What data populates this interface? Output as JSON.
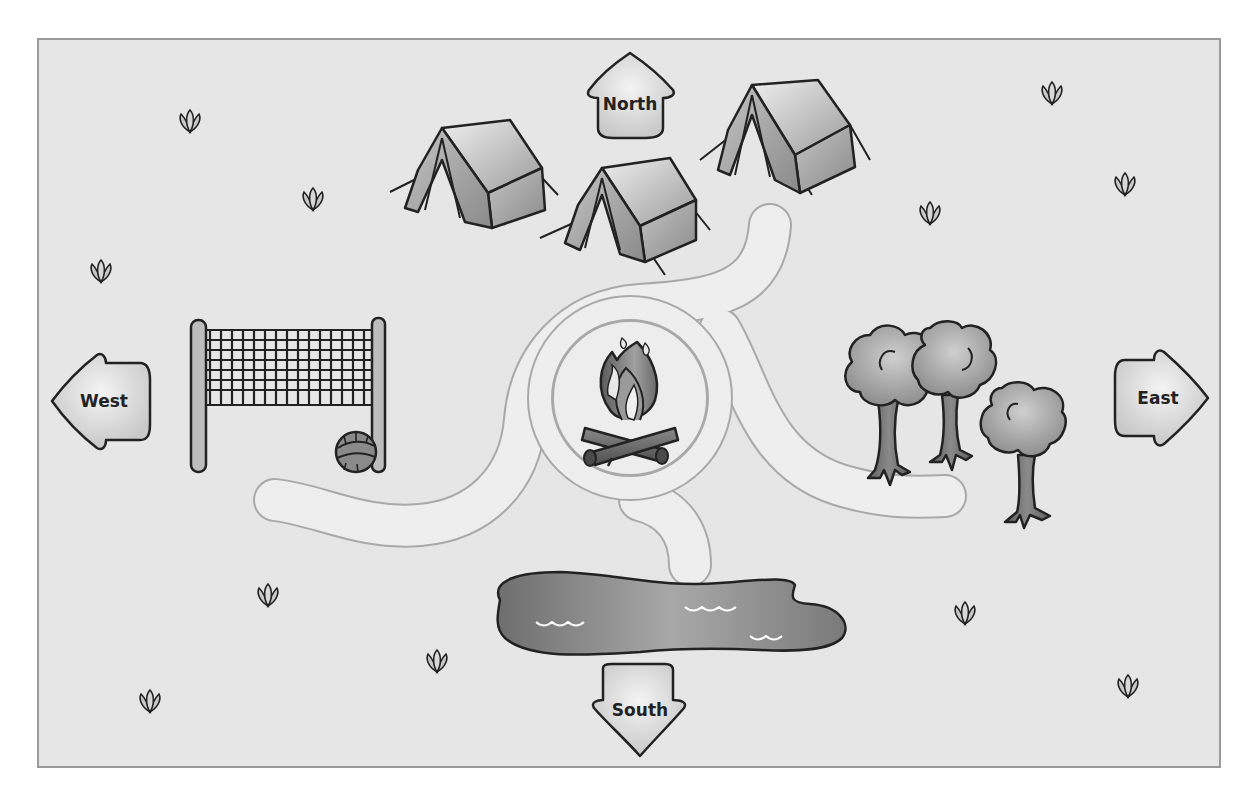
{
  "map": {
    "type": "campground-map",
    "background_color": "#e6e6e6",
    "frame_color": "#9a9a9a"
  },
  "compass": {
    "north": {
      "label": "North",
      "x": 630,
      "y": 100
    },
    "south": {
      "label": "South",
      "x": 640,
      "y": 710
    },
    "west": {
      "label": "West",
      "x": 97,
      "y": 401
    },
    "east": {
      "label": "East",
      "x": 1158,
      "y": 398
    }
  },
  "landmarks": [
    {
      "name": "tents",
      "count": 3,
      "position": "north"
    },
    {
      "name": "campfire",
      "position": "center"
    },
    {
      "name": "volleyball-net",
      "position": "west"
    },
    {
      "name": "volleyball",
      "position": "west"
    },
    {
      "name": "trees",
      "count": 3,
      "position": "east"
    },
    {
      "name": "pond",
      "position": "south"
    }
  ],
  "grass_sprouts": [
    {
      "x": 190,
      "y": 120
    },
    {
      "x": 313,
      "y": 198
    },
    {
      "x": 101,
      "y": 270
    },
    {
      "x": 1052,
      "y": 92
    },
    {
      "x": 1125,
      "y": 183
    },
    {
      "x": 930,
      "y": 212
    },
    {
      "x": 268,
      "y": 594
    },
    {
      "x": 437,
      "y": 660
    },
    {
      "x": 150,
      "y": 700
    },
    {
      "x": 965,
      "y": 612
    },
    {
      "x": 1128,
      "y": 685
    }
  ]
}
